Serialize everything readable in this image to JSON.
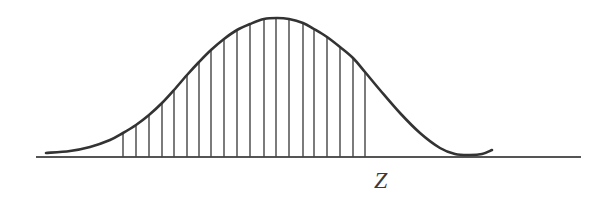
{
  "diagram": {
    "type": "normal-distribution-curve",
    "axis_label": "Z",
    "stroke_color": "#333333",
    "baseline": {
      "x1": 36,
      "x2": 581,
      "y": 157
    },
    "curve_points": [
      [
        46,
        153
      ],
      [
        70,
        151
      ],
      [
        90,
        147
      ],
      [
        110,
        140
      ],
      [
        123,
        133
      ],
      [
        136,
        125
      ],
      [
        149,
        115
      ],
      [
        162,
        103
      ],
      [
        174,
        90
      ],
      [
        187,
        75
      ],
      [
        199,
        62
      ],
      [
        211,
        50
      ],
      [
        224,
        39
      ],
      [
        237,
        30
      ],
      [
        250,
        24
      ],
      [
        264,
        19
      ],
      [
        277,
        18
      ],
      [
        289,
        19
      ],
      [
        303,
        23
      ],
      [
        314,
        29
      ],
      [
        327,
        37
      ],
      [
        340,
        47
      ],
      [
        353,
        58
      ],
      [
        365,
        72
      ],
      [
        380,
        90
      ],
      [
        400,
        113
      ],
      [
        420,
        133
      ],
      [
        440,
        148
      ],
      [
        455,
        154
      ],
      [
        470,
        155
      ],
      [
        482,
        154
      ],
      [
        492,
        150
      ]
    ],
    "hatch_lines_x": [
      123,
      136,
      149,
      162,
      174,
      187,
      199,
      211,
      224,
      237,
      250,
      264,
      276,
      289,
      303,
      314,
      327,
      340,
      353,
      365
    ]
  }
}
